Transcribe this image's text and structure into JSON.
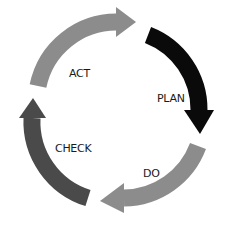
{
  "diagram": {
    "type": "cycle",
    "title": "",
    "stages": [
      {
        "id": "plan",
        "label": "PLAN",
        "color": "#0a0a0a"
      },
      {
        "id": "do",
        "label": "DO",
        "color": "#8c8c8c"
      },
      {
        "id": "check",
        "label": "CHECK",
        "color": "#4a4a4a"
      },
      {
        "id": "act",
        "label": "ACT",
        "color": "#8c8c8c"
      }
    ],
    "direction": "clockwise"
  }
}
